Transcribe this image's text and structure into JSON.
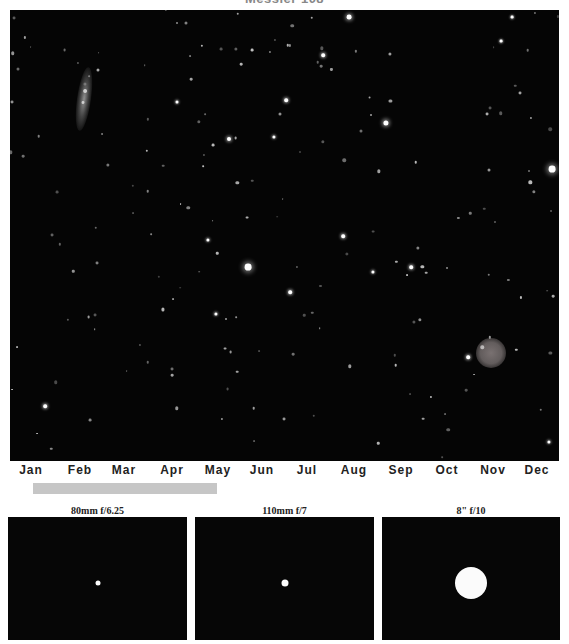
{
  "title": "Messier 108",
  "field": {
    "background": "#050505",
    "bright_stars": [
      {
        "x": 339,
        "y": 7,
        "r": 2.4
      },
      {
        "x": 376,
        "y": 113,
        "r": 2.6
      },
      {
        "x": 542,
        "y": 159,
        "r": 3.4
      },
      {
        "x": 238,
        "y": 257,
        "r": 3.4
      },
      {
        "x": 219,
        "y": 129,
        "r": 2.0
      },
      {
        "x": 276,
        "y": 90,
        "r": 1.8
      },
      {
        "x": 313,
        "y": 45,
        "r": 1.8
      },
      {
        "x": 333,
        "y": 226,
        "r": 1.8
      },
      {
        "x": 280,
        "y": 282,
        "r": 1.8
      },
      {
        "x": 401,
        "y": 257,
        "r": 1.8
      },
      {
        "x": 458,
        "y": 347,
        "r": 1.8
      },
      {
        "x": 198,
        "y": 230,
        "r": 1.6
      },
      {
        "x": 35,
        "y": 396,
        "r": 1.8
      },
      {
        "x": 264,
        "y": 127,
        "r": 1.6
      },
      {
        "x": 167,
        "y": 92,
        "r": 1.5
      },
      {
        "x": 363,
        "y": 262,
        "r": 1.6
      },
      {
        "x": 206,
        "y": 304,
        "r": 1.6
      },
      {
        "x": 539,
        "y": 432,
        "r": 1.6
      },
      {
        "x": 502,
        "y": 7,
        "r": 1.4
      },
      {
        "x": 491,
        "y": 31,
        "r": 1.4
      }
    ],
    "galaxy": {
      "name": "M108",
      "x": 67,
      "y": 57
    },
    "nebula": {
      "name": "M97",
      "x": 466,
      "y": 328
    }
  },
  "months": [
    {
      "label": "Jan",
      "x": 31
    },
    {
      "label": "Feb",
      "x": 80
    },
    {
      "label": "Mar",
      "x": 124
    },
    {
      "label": "Apr",
      "x": 172
    },
    {
      "label": "May",
      "x": 218
    },
    {
      "label": "Jun",
      "x": 262
    },
    {
      "label": "Jul",
      "x": 307
    },
    {
      "label": "Aug",
      "x": 354
    },
    {
      "label": "Sep",
      "x": 401
    },
    {
      "label": "Oct",
      "x": 447
    },
    {
      "label": "Nov",
      "x": 493
    },
    {
      "label": "Dec",
      "x": 537
    }
  ],
  "visibility_bar": {
    "start_month": "Jan",
    "end_month": "May",
    "color": "#c6c6c6"
  },
  "scopes": [
    {
      "label": "80mm f/6.25",
      "left": 8,
      "width": 179,
      "height": 123,
      "disk_diameter": 5
    },
    {
      "label": "110mm f/7",
      "left": 195,
      "width": 179,
      "height": 123,
      "disk_diameter": 7
    },
    {
      "label": "8\" f/10",
      "left": 382,
      "width": 178,
      "height": 123,
      "disk_diameter": 32
    }
  ]
}
